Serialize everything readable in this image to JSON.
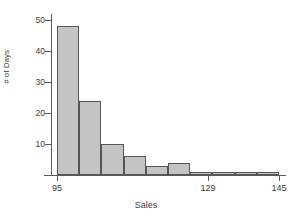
{
  "chart_data": {
    "type": "bar",
    "title": "",
    "subtitle": "",
    "xlabel": "Sales",
    "ylabel": "# of Days",
    "grid": false,
    "legend": null,
    "bin_width": 5,
    "xlim": [
      95,
      145
    ],
    "ylim": [
      0,
      52
    ],
    "bin_edges": [
      95,
      100,
      105,
      110,
      115,
      120,
      125,
      130,
      135,
      140,
      145
    ],
    "categories": [
      "95-100",
      "100-105",
      "105-110",
      "110-115",
      "115-120",
      "120-125",
      "125-130",
      "130-135",
      "135-140",
      "140-145"
    ],
    "values": [
      48,
      24,
      10,
      6,
      3,
      4,
      1,
      1,
      1,
      1
    ],
    "xticks": [
      95,
      129,
      145
    ],
    "xtick_labels": [
      "95",
      "129",
      "145"
    ],
    "yticks": [
      10,
      20,
      30,
      40,
      50
    ],
    "ytick_labels": [
      "10",
      "20",
      "30",
      "40",
      "50"
    ],
    "bar_color": "#c4c4c4",
    "bar_edge_color": "#555555",
    "axis_color": "#5a5a5a",
    "background": "#ffffff"
  }
}
